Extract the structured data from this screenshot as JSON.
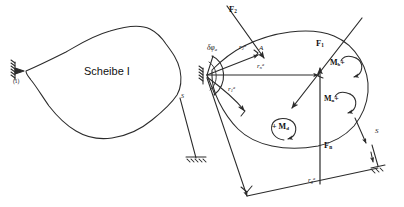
{
  "figure": {
    "title": "Scheibe I",
    "stroke_color": "#2b2b2b",
    "background_color": "#ffffff",
    "width": 404,
    "height": 207
  },
  "left_panel": {
    "body_label": "Scheibe I",
    "support_label": "(1)",
    "joint_label": "S"
  },
  "right_panel": {
    "forces": [
      {
        "name": "F2",
        "base": "F",
        "sub": "2"
      },
      {
        "name": "F1",
        "base": "F",
        "sub": "1"
      },
      {
        "name": "Fn",
        "base": "F",
        "sub": "n"
      }
    ],
    "moments": [
      {
        "name": "Mb",
        "base": "M",
        "sub": "b",
        "sign": "+"
      },
      {
        "name": "Mn",
        "base": "M",
        "sub": "n",
        "sign": "+"
      },
      {
        "name": "Md",
        "base": "M",
        "sub": "d",
        "sign": "+"
      }
    ],
    "radii": [
      {
        "name": "r2a",
        "base": "r",
        "sub": "2",
        "sup": "a"
      },
      {
        "name": "rna",
        "base": "r",
        "sub": "n",
        "sup": "a"
      },
      {
        "name": "r1a",
        "base": "r",
        "sub": "1",
        "sup": "a"
      },
      {
        "name": "rga",
        "base": "r",
        "sub": "g",
        "sup": "a"
      }
    ],
    "rotation": {
      "symbol": "δφ",
      "sub": "a"
    },
    "point_a_label": "A",
    "strut_label": "S"
  }
}
